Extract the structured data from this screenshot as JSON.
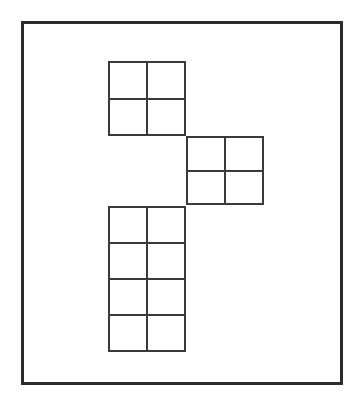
{
  "figure": {
    "canvas": {
      "width": 362,
      "height": 409
    },
    "background_color": "#ffffff",
    "line_color": "#3a3a3a",
    "frame": {
      "name": "outer-border",
      "x": 21,
      "y": 21,
      "width": 322,
      "height": 364,
      "stroke_width": 3,
      "stroke_color": "#2b2b2b"
    },
    "cell_size": 39,
    "blocks": [
      {
        "name": "top-square-block",
        "label": "top 2x2 square group",
        "x": 108,
        "y": 61,
        "cols": 2,
        "rows": 2,
        "cell_width": 39,
        "cell_height": 37.5,
        "stroke_width": 2,
        "stroke_color": "#3a3a3a"
      },
      {
        "name": "middle-square-block",
        "label": "middle 2x2 square group",
        "x": 186,
        "y": 136,
        "cols": 2,
        "rows": 2,
        "cell_width": 39,
        "cell_height": 34.5,
        "stroke_width": 2,
        "stroke_color": "#3a3a3a"
      },
      {
        "name": "bottom-column-block",
        "label": "bottom 2x4 column group",
        "x": 108,
        "y": 206,
        "cols": 2,
        "rows": 4,
        "cell_width": 39,
        "cell_height": 36.5,
        "stroke_width": 2,
        "stroke_color": "#3a3a3a"
      }
    ],
    "total_cells": 12
  },
  "chart_data": {
    "type": "diagram",
    "title": "",
    "units": "cells",
    "blocks": [
      {
        "name": "top",
        "cols": 2,
        "rows": 2,
        "cells": 4,
        "grid_origin": [
          0,
          0
        ]
      },
      {
        "name": "middle",
        "cols": 2,
        "rows": 2,
        "cells": 4,
        "grid_origin": [
          2,
          2
        ]
      },
      {
        "name": "bottom",
        "cols": 2,
        "rows": 4,
        "cells": 8,
        "grid_origin": [
          0,
          4
        ]
      }
    ],
    "values": [
      4,
      4,
      8
    ],
    "categories": [
      "top",
      "middle",
      "bottom"
    ],
    "total": 16,
    "grid": true,
    "legend": false
  }
}
